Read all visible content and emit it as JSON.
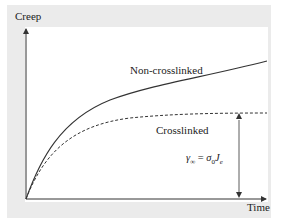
{
  "diagram": {
    "y_axis_label": "Creep",
    "x_axis_label": "Time",
    "curves": [
      {
        "name": "Non-crosslinked",
        "style": "solid"
      },
      {
        "name": "Crosslinked",
        "style": "dashed"
      }
    ],
    "annotation": "γ∞ = σ0Je",
    "annotation_parts": {
      "gamma": "γ",
      "gamma_sub": "∞",
      "eq": " = ",
      "sigma": "σ",
      "sigma_sub": "0",
      "J": "J",
      "J_sub": "e"
    },
    "colors": {
      "background": "#ebebeb",
      "plot": "#ffffff",
      "line": "#333333"
    }
  }
}
